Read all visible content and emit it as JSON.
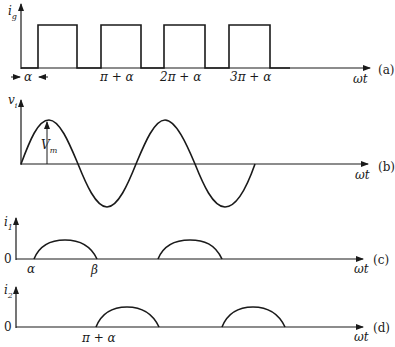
{
  "figure": {
    "colors": {
      "stroke": "#1a1a1a",
      "background": "#ffffff"
    },
    "panels": [
      {
        "id": "a",
        "tag": "(a)",
        "y_label": "i",
        "y_label_sub": "g",
        "x_label": "ωt",
        "alpha_marker": "α",
        "tick_labels": [
          "π + α",
          "2π + α",
          "3π + α"
        ],
        "description": "Gate current pulse train, pulses starting at α, π+α, 2π+α, 3π+α"
      },
      {
        "id": "b",
        "tag": "(b)",
        "y_label": "v",
        "y_label_sub": "i",
        "x_label": "ωt",
        "amplitude_label": "V",
        "amplitude_label_sub": "m",
        "description": "Sinusoidal input voltage with amplitude Vm"
      },
      {
        "id": "c",
        "tag": "(c)",
        "y_label": "i",
        "y_label_sub": "1",
        "zero_label": "0",
        "x_label": "ωt",
        "tick_labels": [
          "α",
          "β"
        ],
        "description": "Current i1 conducting from α to β in positive half cycles"
      },
      {
        "id": "d",
        "tag": "(d)",
        "y_label": "i",
        "y_label_sub": "2",
        "zero_label": "0",
        "x_label": "ωt",
        "tick_labels": [
          "π + α"
        ],
        "description": "Current i2 conducting starting at π+α in negative half cycles"
      }
    ]
  }
}
